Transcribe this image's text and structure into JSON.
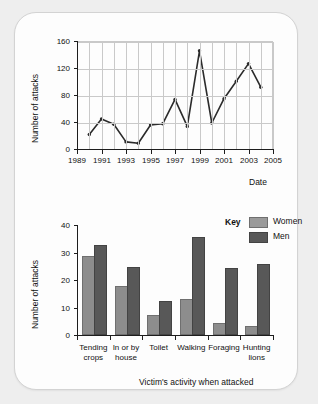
{
  "chart_data": [
    {
      "type": "line",
      "title": "",
      "xlabel": "Date",
      "ylabel": "Number of attacks",
      "xlim": [
        1989,
        2005
      ],
      "ylim": [
        0,
        160
      ],
      "ytick_labels": [
        "0",
        "40",
        "80",
        "120",
        "160"
      ],
      "yticks": [
        0,
        40,
        80,
        120,
        160
      ],
      "xtick_labels": [
        "1989",
        "1991",
        "1993",
        "1995",
        "1997",
        "1999",
        "2001",
        "2003",
        "2005"
      ],
      "xticks": [
        1989,
        1991,
        1993,
        1995,
        1997,
        1999,
        2001,
        2003,
        2005
      ],
      "grid": "both",
      "legend": "none",
      "x": [
        1990,
        1991,
        1992,
        1993,
        1994,
        1995,
        1996,
        1997,
        1998,
        1999,
        2000,
        2001,
        2002,
        2003,
        2004
      ],
      "values": [
        23,
        46,
        38,
        12,
        10,
        37,
        39,
        75,
        35,
        147,
        40,
        76,
        102,
        128,
        93
      ]
    },
    {
      "type": "bar",
      "title": "",
      "xlabel": "Victim's activity when attacked",
      "ylabel": "Number of attacks",
      "ylim": [
        0,
        40
      ],
      "ytick_labels": [
        "0",
        "10",
        "20",
        "30",
        "40"
      ],
      "yticks": [
        0,
        10,
        20,
        30,
        40
      ],
      "grid": "none",
      "legend": "inside-top-right",
      "legend_title": "Key",
      "categories": [
        "Tending crops",
        "In or by house",
        "Toilet",
        "Walking",
        "Foraging",
        "Hunting lions"
      ],
      "category_lines": [
        [
          "Tending",
          "crops"
        ],
        [
          "In or by",
          "house"
        ],
        [
          "Toilet",
          ""
        ],
        [
          "Walking",
          ""
        ],
        [
          "Foraging",
          ""
        ],
        [
          "Hunting",
          "lions"
        ]
      ],
      "series": [
        {
          "name": "Women",
          "color": "#8d8d8d",
          "values": [
            28,
            17,
            6.5,
            12.5,
            3.5,
            2.5
          ]
        },
        {
          "name": "Men",
          "color": "#585858",
          "values": [
            32,
            24,
            11.5,
            35,
            23.5,
            25
          ]
        }
      ]
    }
  ],
  "colors": {
    "background": "#eeeeee",
    "card": "#fdfdfd",
    "line": "#2b2b2b",
    "grid": "#c9c9c9",
    "axis": "#1d1d1d",
    "women": "#8d8d8d",
    "men": "#585858"
  }
}
